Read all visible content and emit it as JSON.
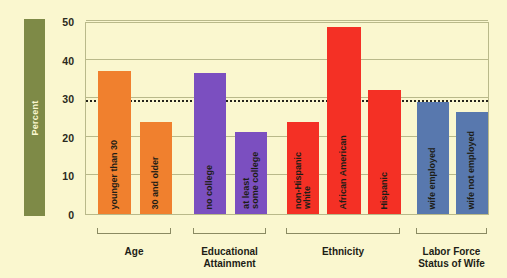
{
  "chart_data": {
    "type": "bar",
    "title": "",
    "xlabel": "",
    "ylabel": "Percent",
    "ylim": [
      0,
      50
    ],
    "yticks": [
      0,
      10,
      20,
      30,
      40,
      50
    ],
    "grid": true,
    "legend": "none",
    "reference_line": {
      "value": 29,
      "style": "dotted",
      "label": ""
    },
    "groups": [
      {
        "name": "Age",
        "color": "#f0802e",
        "categories": [
          "younger than 30",
          "30 and older"
        ],
        "values": [
          37.0,
          23.8
        ]
      },
      {
        "name": "Educational Attainment",
        "color": "#7b4fc0",
        "categories": [
          "no college",
          "at least some college"
        ],
        "values": [
          36.5,
          21.2
        ]
      },
      {
        "name": "Ethnicity",
        "color": "#f43025",
        "categories": [
          "non-Hispanic white",
          "African American",
          "Hispanic"
        ],
        "values": [
          23.9,
          48.5,
          32.2
        ]
      },
      {
        "name": "Labor Force Status of Wife",
        "color": "#5878ae",
        "categories": [
          "wife employed",
          "wife not employed"
        ],
        "values": [
          29.0,
          26.3
        ]
      }
    ]
  },
  "axis": {
    "band_label": "Percent",
    "tick_labels": [
      "50",
      "40",
      "30",
      "20",
      "10",
      "0"
    ]
  },
  "bars": [
    {
      "label": "younger than 30",
      "label_lines": [
        "younger than 30"
      ],
      "value": 37.0,
      "color": "#f0802e",
      "group": "Age"
    },
    {
      "label": "30 and older",
      "label_lines": [
        "30 and older"
      ],
      "value": 23.8,
      "color": "#f0802e",
      "group": "Age"
    },
    {
      "label": "no college",
      "label_lines": [
        "no college"
      ],
      "value": 36.5,
      "color": "#7b4fc0",
      "group": "Educational Attainment"
    },
    {
      "label": "at least some college",
      "label_lines": [
        "at least",
        "some college"
      ],
      "value": 21.2,
      "color": "#7b4fc0",
      "group": "Educational Attainment"
    },
    {
      "label": "non-Hispanic white",
      "label_lines": [
        "non-Hispanic",
        "white"
      ],
      "value": 23.9,
      "color": "#f43025",
      "group": "Ethnicity"
    },
    {
      "label": "African American",
      "label_lines": [
        "African American"
      ],
      "value": 48.5,
      "color": "#f43025",
      "group": "Ethnicity"
    },
    {
      "label": "Hispanic",
      "label_lines": [
        "Hispanic"
      ],
      "value": 32.2,
      "color": "#f43025",
      "group": "Ethnicity"
    },
    {
      "label": "wife employed",
      "label_lines": [
        "wife employed"
      ],
      "value": 29.0,
      "color": "#5878ae",
      "group": "Labor Force Status of Wife"
    },
    {
      "label": "wife not employed",
      "label_lines": [
        "wife not employed"
      ],
      "value": 26.3,
      "color": "#5878ae",
      "group": "Labor Force Status of Wife"
    }
  ],
  "group_captions": [
    {
      "lines": [
        "Age"
      ]
    },
    {
      "lines": [
        "Educational",
        "Attainment"
      ]
    },
    {
      "lines": [
        "Ethnicity"
      ]
    },
    {
      "lines": [
        "Labor Force",
        "Status of Wife"
      ]
    }
  ],
  "colors": {
    "background": "#faf7cf",
    "band": "#7e8a47",
    "grid": "#b9b98a",
    "text": "#1d1d16",
    "orange": "#f0802e",
    "purple": "#7b4fc0",
    "red": "#f43025",
    "blue": "#5878ae"
  }
}
